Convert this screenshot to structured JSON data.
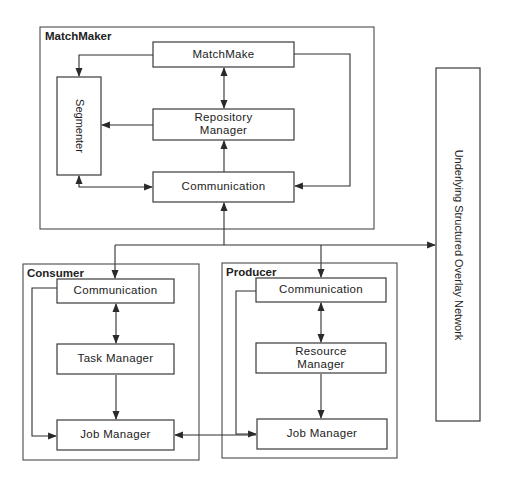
{
  "diagram": {
    "groups": {
      "matchmaker": {
        "label": "MatchMaker"
      },
      "consumer": {
        "label": "Consumer"
      },
      "producer": {
        "label": "Producer"
      }
    },
    "matchmaker": {
      "matchmake": "MatchMake",
      "segmenter": "Segmenter",
      "repository_line1": "Repository",
      "repository_line2": "Manager",
      "communication": "Communication"
    },
    "consumer": {
      "communication": "Communication",
      "task_manager": "Task Manager",
      "job_manager": "Job Manager"
    },
    "producer": {
      "communication": "Communication",
      "resource_line1": "Resource",
      "resource_line2": "Manager",
      "job_manager": "Job Manager"
    },
    "overlay_network": "Underlying Structured Overlay Network",
    "colors": {
      "stroke": "#2e2e2e",
      "background": "#ffffff",
      "text": "#222222"
    }
  }
}
